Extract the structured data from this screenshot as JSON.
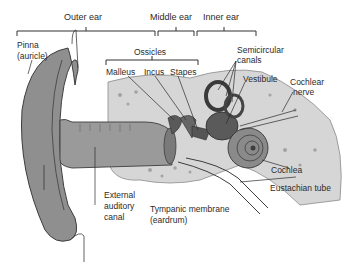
{
  "diagram": {
    "sections": [
      {
        "label": "Outer ear"
      },
      {
        "label": "Middle ear"
      },
      {
        "label": "Inner ear"
      }
    ],
    "labels": {
      "pinna": "Pinna",
      "pinna_alt": "(auricle)",
      "ossicles": "Ossicles",
      "malleus": "Malleus",
      "incus": "Incus",
      "stapes": "Stapes",
      "semicircular_1": "Semicircular",
      "semicircular_2": "canals",
      "vestibule": "Vestibule",
      "cochlear_nerve_1": "Cochlear",
      "cochlear_nerve_2": "nerve",
      "cochlea": "Cochlea",
      "eustachian": "Eustachian tube",
      "eac_1": "External",
      "eac_2": "auditory",
      "eac_3": "canal",
      "tympanic_1": "Tympanic membrane",
      "tympanic_2": "(eardrum)"
    },
    "colors": {
      "tissue": "#8f8f8f",
      "tissue_dark": "#5a5a5a",
      "bone": "#cfcfcf",
      "bone_spots": "#9a9a9a",
      "line": "#2b2b2b"
    }
  }
}
